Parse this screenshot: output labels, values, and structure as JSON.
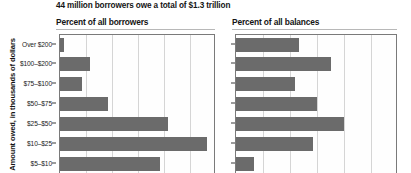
{
  "figure": {
    "title": "44 million borrowers owe a total of $1.3 trillion",
    "axis_title": "Amount owed, in thousands of dollars",
    "bar_color": "#6b6b6b",
    "grid_color": "#d5d5d5",
    "axis_color": "#7a7a7a"
  },
  "panels": {
    "left_header": "Percent of all borrowers",
    "right_header": "Percent of all balances"
  },
  "categories": [
    "Over $200",
    "$100–$200",
    "$75–$100",
    "$50–$75",
    "$25–$50",
    "$10–$25",
    "$5–$10"
  ],
  "chart_data": {
    "type": "bar",
    "orientation": "horizontal",
    "title": "44 million borrowers owe a total of $1.3 trillion",
    "xlabel": "",
    "ylabel": "Amount owed, in thousands of dollars",
    "categories": [
      "Over $200",
      "$100–$200",
      "$75–$100",
      "$50–$75",
      "$25–$50",
      "$10–$25",
      "$5–$10"
    ],
    "panels": [
      {
        "name": "Percent of all borrowers",
        "values": [
          1,
          7,
          5,
          11,
          25,
          34,
          23
        ],
        "xlim": [
          0,
          36
        ],
        "gridlines": [
          6,
          12,
          18,
          24,
          30
        ],
        "grid": true
      },
      {
        "name": "Percent of all balances",
        "values": [
          14,
          21,
          13,
          18,
          24,
          17,
          4
        ],
        "xlim": [
          0,
          36
        ],
        "gridlines": [
          6,
          12,
          18,
          24,
          30
        ],
        "grid": true
      }
    ],
    "legend": "none",
    "note": "Bottom of figure is cropped; additional smaller-balance categories are cut off below the $5–$10 row."
  }
}
